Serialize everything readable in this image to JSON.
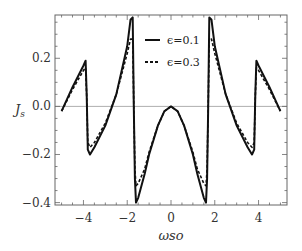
{
  "chart_data": {
    "type": "line",
    "title": "",
    "xlabel": "ωso",
    "ylabel": "J_s",
    "xlim": [
      -5.3,
      5.3
    ],
    "ylim": [
      -0.41,
      0.38
    ],
    "xticks": [
      -4,
      -2,
      0,
      2,
      4
    ],
    "yticks": [
      -0.4,
      -0.2,
      0.0,
      0.2
    ],
    "ytick_labels": [
      "−0.4",
      "−0.2",
      "0.0",
      "0.2"
    ],
    "xtick_labels": [
      "−4",
      "−2",
      "0",
      "2",
      "4"
    ],
    "grid": false,
    "zero_line": true,
    "legend_position": "upper center",
    "series": [
      {
        "name": "ϵ=0.1",
        "style": "solid",
        "color": "#111111",
        "x": [
          -5.0,
          -4.5,
          -4.0,
          -3.9,
          -3.85,
          -3.8,
          -3.7,
          -3.5,
          -3.0,
          -2.5,
          -2.0,
          -1.85,
          -1.75,
          -1.7,
          -1.65,
          -1.6,
          -1.5,
          -1.2,
          -1.0,
          -0.6,
          -0.3,
          0.0,
          0.3,
          0.6,
          1.0,
          1.2,
          1.5,
          1.6,
          1.65,
          1.7,
          1.75,
          1.85,
          2.0,
          2.5,
          3.0,
          3.5,
          3.7,
          3.8,
          3.85,
          3.9,
          4.0,
          4.5,
          5.0
        ],
        "y": [
          -0.02,
          0.08,
          0.17,
          0.19,
          0.05,
          -0.18,
          -0.2,
          -0.17,
          -0.08,
          0.05,
          0.25,
          0.36,
          0.37,
          0.0,
          -0.3,
          -0.4,
          -0.38,
          -0.28,
          -0.2,
          -0.08,
          -0.02,
          0.0,
          -0.02,
          -0.08,
          -0.2,
          -0.28,
          -0.38,
          -0.4,
          -0.3,
          0.0,
          0.37,
          0.36,
          0.25,
          0.05,
          -0.08,
          -0.17,
          -0.2,
          -0.18,
          0.05,
          0.19,
          0.17,
          0.08,
          -0.02
        ]
      },
      {
        "name": "ϵ=0.3",
        "style": "dashed",
        "color": "#111111",
        "x": [
          -5.0,
          -4.5,
          -4.0,
          -3.9,
          -3.85,
          -3.8,
          -3.7,
          -3.5,
          -3.0,
          -2.5,
          -2.0,
          -1.85,
          -1.75,
          -1.7,
          -1.65,
          -1.6,
          -1.5,
          -1.2,
          -1.0,
          -0.6,
          -0.3,
          0.0,
          0.3,
          0.6,
          1.0,
          1.2,
          1.5,
          1.6,
          1.65,
          1.7,
          1.75,
          1.85,
          2.0,
          2.5,
          3.0,
          3.5,
          3.7,
          3.8,
          3.85,
          3.9,
          4.0,
          4.5,
          5.0
        ],
        "y": [
          -0.02,
          0.07,
          0.15,
          0.16,
          0.04,
          -0.15,
          -0.17,
          -0.15,
          -0.07,
          0.05,
          0.22,
          0.28,
          0.28,
          0.0,
          -0.26,
          -0.33,
          -0.32,
          -0.26,
          -0.19,
          -0.08,
          -0.02,
          0.0,
          -0.02,
          -0.08,
          -0.19,
          -0.26,
          -0.32,
          -0.33,
          -0.26,
          0.0,
          0.28,
          0.28,
          0.22,
          0.05,
          -0.07,
          -0.15,
          -0.17,
          -0.15,
          0.04,
          0.16,
          0.15,
          0.07,
          -0.02
        ]
      }
    ]
  },
  "legend": {
    "items": [
      {
        "label": "ϵ=0.1",
        "style": "solid"
      },
      {
        "label": "ϵ=0.3",
        "style": "dashed"
      }
    ]
  },
  "axes": {
    "xlabel": "ωso",
    "ylabel_main": "J",
    "ylabel_sub": "s"
  }
}
